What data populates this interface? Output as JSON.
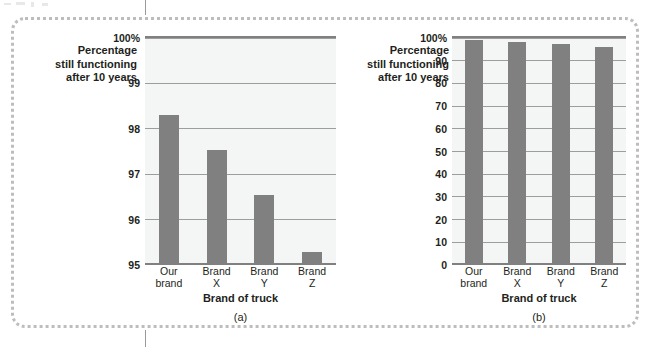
{
  "figure": {
    "panels": [
      {
        "key": "a",
        "caption": "(a)",
        "y_axis_label": [
          "Percentage",
          "still functioning",
          "after 10 years"
        ],
        "x_axis_title": "Brand of truck",
        "y_ticks": [
          "100%",
          "99",
          "98",
          "97",
          "96",
          "95"
        ]
      },
      {
        "key": "b",
        "caption": "(b)",
        "y_axis_label": [
          "Percentage",
          "still functioning",
          "after 10 years"
        ],
        "x_axis_title": "Brand of truck",
        "y_ticks": [
          "100%",
          "90",
          "80",
          "70",
          "60",
          "50",
          "40",
          "30",
          "20",
          "10",
          "0"
        ]
      }
    ],
    "colors": {
      "bar": "#808080",
      "plot_background": "#f4f5f5",
      "gridline": "#9d9d9d",
      "axis": "#808080",
      "frame_dots": "#bdbdbd",
      "text": "#231f20"
    }
  },
  "chart_data": [
    {
      "type": "bar",
      "title": "(a)",
      "categories": [
        "Our brand",
        "Brand X",
        "Brand Y",
        "Brand Z"
      ],
      "category_lines": [
        [
          "Our",
          "brand"
        ],
        [
          "Brand",
          "X"
        ],
        [
          "Brand",
          "Y"
        ],
        [
          "Brand",
          "Z"
        ]
      ],
      "values": [
        98.25,
        97.5,
        96.5,
        95.25
      ],
      "xlabel": "Brand of truck",
      "ylabel": "Percentage still functioning after 10 years",
      "ylim": [
        95,
        100
      ],
      "yticks": [
        95,
        96,
        97,
        98,
        99,
        100
      ],
      "ytick_labels": [
        "95",
        "96",
        "97",
        "98",
        "99",
        "100%"
      ],
      "grid": true,
      "legend": "none"
    },
    {
      "type": "bar",
      "title": "(b)",
      "categories": [
        "Our brand",
        "Brand X",
        "Brand Y",
        "Brand Z"
      ],
      "category_lines": [
        [
          "Our",
          "brand"
        ],
        [
          "Brand",
          "X"
        ],
        [
          "Brand",
          "Y"
        ],
        [
          "Brand",
          "Z"
        ]
      ],
      "values": [
        98.25,
        97.5,
        96.5,
        95.25
      ],
      "xlabel": "Brand of truck",
      "ylabel": "Percentage still functioning after 10 years",
      "ylim": [
        0,
        100
      ],
      "yticks": [
        0,
        10,
        20,
        30,
        40,
        50,
        60,
        70,
        80,
        90,
        100
      ],
      "ytick_labels": [
        "0",
        "10",
        "20",
        "30",
        "40",
        "50",
        "60",
        "70",
        "80",
        "90",
        "100%"
      ],
      "grid": true,
      "legend": "none"
    }
  ]
}
